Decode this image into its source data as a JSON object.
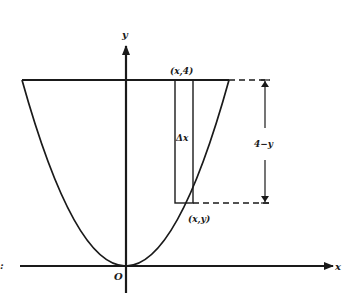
{
  "figure": {
    "type": "diagram",
    "colors": {
      "ink": "#1a1a1a",
      "background": "#ffffff"
    }
  },
  "axes": {
    "x_label": "x",
    "y_label": "y",
    "origin_label": "O",
    "left_edge_label": ":"
  },
  "annotations": {
    "top_point": "(x,4)",
    "curve_point": "(x,y)",
    "strip_width": "Δx",
    "height_dimension": "4−y"
  }
}
